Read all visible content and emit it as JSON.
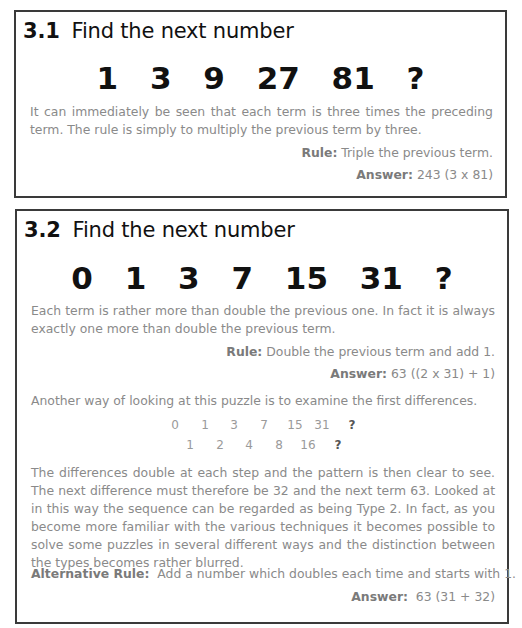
{
  "puzzles": [
    {
      "number": "3.1",
      "title": "Find the next number",
      "sequence": [
        "1",
        "3",
        "9",
        "27",
        "81",
        "?"
      ],
      "explanation": "It can immediately be seen that each term is three times the preceding term. The rule is simply to multiply the previous term by three.",
      "rule_label": "Rule:",
      "rule_text": " Triple the previous term.",
      "answer_label": "Answer:",
      "answer_text": " 243 (3 x  81)"
    },
    {
      "number": "3.2",
      "title": "Find the next number",
      "sequence": [
        "0",
        "1",
        "3",
        "7",
        "15",
        "31",
        "?"
      ],
      "explanation": "Each term is rather more than double the previous one.  In fact it is always exactly one more than double the previous term.",
      "rule_label": "Rule:",
      "rule_text": " Double the previous term and add 1.",
      "answer_label": "Answer:",
      "answer_text": " 63 ((2 x 31) + 1)",
      "differences_intro": "Another way of looking at this puzzle is to examine the first differences.",
      "differences_table": {
        "terms": [
          "0",
          "1",
          "3",
          "7",
          "15",
          "31",
          "?"
        ],
        "differences": [
          "1",
          "2",
          "4",
          "8",
          "16",
          "?"
        ]
      },
      "differences_explanation": "The differences double at each step and the pattern is then clear to see.  The next difference must therefore be 32 and the next term 63.  Looked at in this way the sequence can be regarded as being Type 2.  In fact, as you become more familiar with the various techniques it becomes possible to solve some puzzles in several different ways and the distinction between the types becomes rather blurred.",
      "alt_rule_label": "Alternative Rule:",
      "alt_rule_text": "  Add a number which doubles each time and starts with 1.",
      "alt_answer_label": "Answer:",
      "alt_answer_text": "  63 (31 + 32)"
    }
  ],
  "colors": {
    "heading": "#111111",
    "body_text": "#8a8a8a",
    "border": "#3a3a3a"
  }
}
